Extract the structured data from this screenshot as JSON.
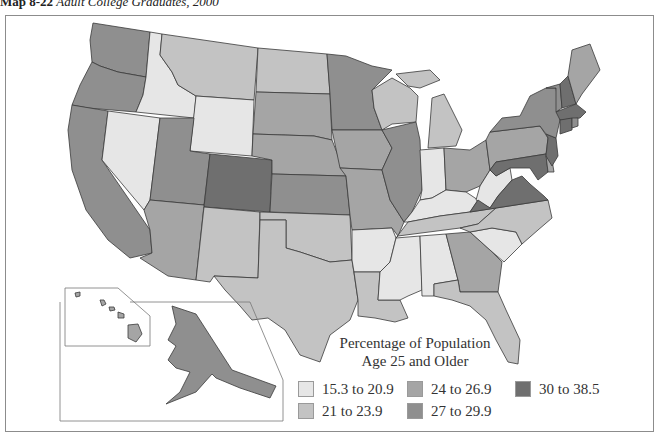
{
  "header": {
    "map_number": "Map 8-22",
    "map_title": "Adult College Graduates, 2000"
  },
  "legend": {
    "title_line1": "Percentage of Population",
    "title_line2": "Age 25 and Older",
    "classes": [
      {
        "id": "c1",
        "label": "15.3 to 20.9",
        "color": "#e6e6e6"
      },
      {
        "id": "c2",
        "label": "21 to 23.9",
        "color": "#c3c3c3"
      },
      {
        "id": "c3",
        "label": "24 to 26.9",
        "color": "#a5a5a5"
      },
      {
        "id": "c4",
        "label": "27 to 29.9",
        "color": "#8f8f8f"
      },
      {
        "id": "c5",
        "label": "30 to 38.5",
        "color": "#6f6f6f"
      }
    ]
  },
  "map_data": {
    "type": "choropleth",
    "region": "United States",
    "states": {
      "WA": "c4",
      "OR": "c4",
      "CA": "c4",
      "ID": "c1",
      "NV": "c1",
      "MT": "c2",
      "WY": "c1",
      "UT": "c4",
      "AZ": "c3",
      "CO": "c5",
      "NM": "c2",
      "ND": "c2",
      "SD": "c3",
      "NE": "c3",
      "KS": "c4",
      "OK": "c2",
      "TX": "c2",
      "MN": "c4",
      "IA": "c3",
      "MO": "c3",
      "AR": "c1",
      "LA": "c2",
      "WI": "c2",
      "IL": "c4",
      "MI": "c2",
      "IN": "c1",
      "OH": "c3",
      "KY": "c1",
      "TN": "c2",
      "MS": "c1",
      "AL": "c1",
      "GA": "c3",
      "FL": "c2",
      "SC": "c1",
      "NC": "c2",
      "VA": "c5",
      "WV": "c1",
      "PA": "c3",
      "NY": "c4",
      "VT": "c4",
      "NH": "c5",
      "ME": "c3",
      "MA": "c5",
      "CT": "c5",
      "RI": "c4",
      "NJ": "c5",
      "DE": "c3",
      "MD": "c5",
      "AK": "c4",
      "HI": "c3"
    }
  }
}
